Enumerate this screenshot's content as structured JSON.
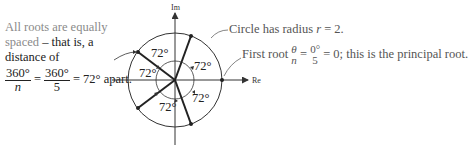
{
  "left_note": {
    "line1": "All roots are equally",
    "line2_gray": "spaced",
    "line2_dash": " – ",
    "line2_rest": "that is, a",
    "line3": "distance of",
    "frac1_num": "360°",
    "frac1_den": "n",
    "eq1": " = ",
    "frac2_num": "360°",
    "frac2_den": "5",
    "eq2": " = 72° apart."
  },
  "annotations": {
    "radius": "Circle has radius ",
    "radius_var": "r",
    "radius_val": " = 2.",
    "first_root_prefix": "First root ",
    "first_root_frac1_num": "θ",
    "first_root_frac1_den": "n",
    "first_root_eq": " = ",
    "first_root_frac2_num": "0°",
    "first_root_frac2_den": "5",
    "first_root_suffix": " = 0; this is the principal root."
  },
  "diagram": {
    "axis_x_label": "Re",
    "axis_y_label": "Im",
    "radius": 2,
    "n_roots": 5,
    "angle_labels": [
      "72°",
      "72°",
      "72°",
      "72°",
      "72°"
    ],
    "root_angles_deg": [
      0,
      72,
      144,
      216,
      288
    ]
  }
}
